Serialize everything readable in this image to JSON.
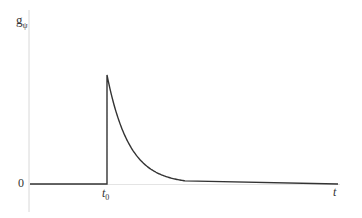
{
  "chart_data": {
    "type": "line",
    "title": "",
    "xlabel": "t",
    "ylabel": "g_ψ",
    "ylabel_main": "g",
    "ylabel_sub": "ψ",
    "x_ticks": [
      {
        "label_main": "t",
        "label_sub": "0",
        "position": "t0"
      }
    ],
    "y_ticks": [
      {
        "label": "0",
        "value": 0
      }
    ],
    "series": [
      {
        "name": "g_ψ(t)",
        "x": [
          0,
          0.3,
          0.3,
          0.35,
          0.4,
          0.45,
          0.5,
          0.55,
          1.0
        ],
        "values": [
          0,
          0,
          1.0,
          0.55,
          0.3,
          0.14,
          0.05,
          0,
          0
        ]
      }
    ],
    "grid": false,
    "legend": null,
    "color": "#333333",
    "axis_color": "#d8d8d8"
  },
  "labels": {
    "zero": "0",
    "t0_main": "t",
    "t0_sub": "0",
    "t": "t",
    "y_main": "g",
    "y_sub": "ψ"
  }
}
